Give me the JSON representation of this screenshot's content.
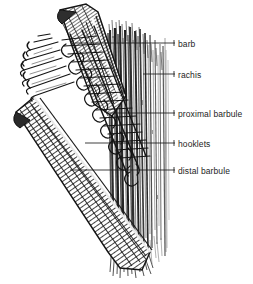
{
  "figure": {
    "kind": "anatomical-line-drawing",
    "background_color": "#ffffff",
    "ink_color": "#1d1d1d",
    "label_color": "#1d1d1d"
  },
  "labels": [
    {
      "id": "barb",
      "text": "barb",
      "text_x": 178,
      "text_y": 39,
      "leader_x1": 75,
      "leader_x2": 175,
      "leader_y": 43,
      "tick": true
    },
    {
      "id": "rachis",
      "text": "rachis",
      "text_x": 178,
      "text_y": 70,
      "leader_x1": 143,
      "leader_x2": 175,
      "leader_y": 74,
      "tick": true
    },
    {
      "id": "proximal-barbule",
      "text": "proximal barbule",
      "text_x": 178,
      "text_y": 109,
      "leader_x1": 106,
      "leader_x2": 175,
      "leader_y": 113,
      "tick": true
    },
    {
      "id": "hooklets",
      "text": "hooklets",
      "text_x": 178,
      "text_y": 139,
      "leader_x1": 85,
      "leader_x2": 175,
      "leader_y": 143,
      "tick": true
    },
    {
      "id": "distal-barbule",
      "text": "distal barbule",
      "text_x": 178,
      "text_y": 166,
      "leader_x1": 70,
      "leader_x2": 175,
      "leader_y": 170,
      "tick": true
    }
  ],
  "structures": {
    "upper_barb_label": "upper barb shaft",
    "lower_barb_label": "lower barb shaft",
    "rachis_label": "rachis shaft",
    "vane_label": "vane barb filaments",
    "hooklet_row_label": "hooklet row"
  }
}
